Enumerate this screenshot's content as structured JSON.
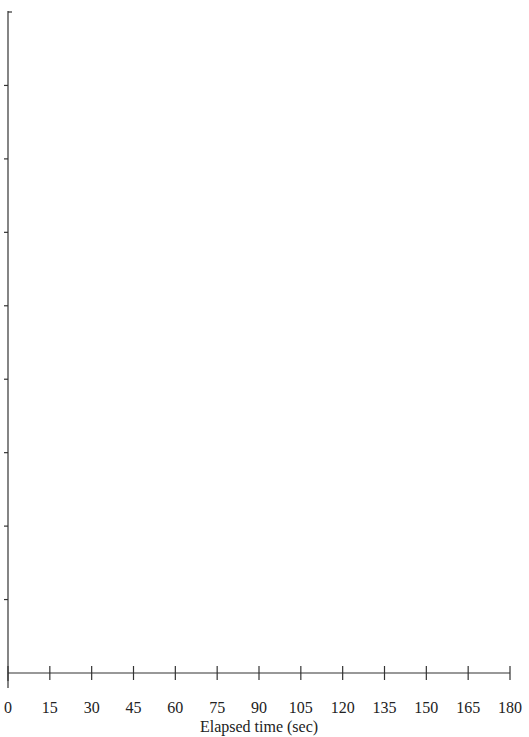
{
  "chart_data": {
    "type": "line",
    "title": "",
    "xlabel": "Elapsed time (sec)",
    "ylabel": "",
    "x_ticks": [
      0,
      15,
      30,
      45,
      60,
      75,
      90,
      105,
      120,
      135,
      150,
      165,
      180
    ],
    "x_tick_labels": [
      "0",
      "15",
      "30",
      "45",
      "60",
      "75",
      "90",
      "105",
      "120",
      "135",
      "150",
      "165",
      "180"
    ],
    "xlim": [
      0,
      180
    ],
    "y_tick_count": 9,
    "y_tick_labels": [],
    "series": [],
    "grid": false,
    "legend": null,
    "note": "Empty axes template; no data plotted and y-axis is unlabeled. Top edge text is cropped and illegible."
  },
  "colors": {
    "axis": "#333333",
    "text": "#222222",
    "background": "#ffffff"
  }
}
